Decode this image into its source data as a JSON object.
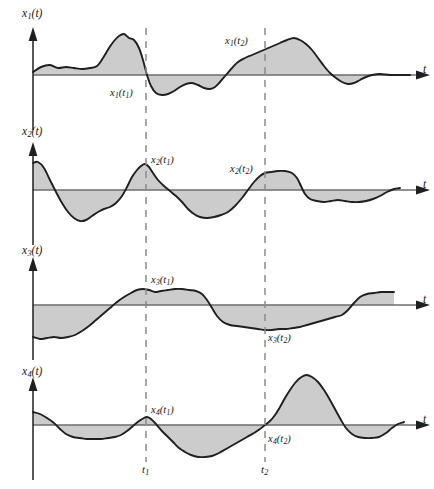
{
  "figure": {
    "type": "ensemble-of-sample-functions",
    "panel_count": 4,
    "line_color": "#1f1f1f",
    "fill_color": "#c9c9c9",
    "dash_color": "#8a8a8a",
    "background": "#ffffff"
  },
  "axes": {
    "time_axis_label": "t",
    "tick_labels": [
      {
        "name": "t1",
        "base": "t",
        "sub": "1",
        "x": 146
      },
      {
        "name": "t2",
        "base": "t",
        "sub": "2",
        "x": 265
      }
    ]
  },
  "panels": [
    {
      "id": "panel-1",
      "axis_label": {
        "base": "x",
        "sub": "1",
        "arg": "(t)"
      },
      "point_labels": [
        {
          "base": "x",
          "sub": "1",
          "arg": "(t",
          "argsub": "1",
          "argend": ")"
        },
        {
          "base": "x",
          "sub": "1",
          "arg": "(t",
          "argsub": "2",
          "argend": ")"
        }
      ]
    },
    {
      "id": "panel-2",
      "axis_label": {
        "base": "x",
        "sub": "2",
        "arg": "(t)"
      },
      "point_labels": [
        {
          "base": "x",
          "sub": "2",
          "arg": "(t",
          "argsub": "1",
          "argend": ")"
        },
        {
          "base": "x",
          "sub": "2",
          "arg": "(t",
          "argsub": "2",
          "argend": ")"
        }
      ]
    },
    {
      "id": "panel-3",
      "axis_label": {
        "base": "x",
        "sub": "3",
        "arg": "(t)"
      },
      "point_labels": [
        {
          "base": "x",
          "sub": "3",
          "arg": "(t",
          "argsub": "1",
          "argend": ")"
        },
        {
          "base": "x",
          "sub": "3",
          "arg": "(t",
          "argsub": "2",
          "argend": ")"
        }
      ]
    },
    {
      "id": "panel-4",
      "axis_label": {
        "base": "x",
        "sub": "4",
        "arg": "(t)"
      },
      "point_labels": [
        {
          "base": "x",
          "sub": "4",
          "arg": "(t",
          "argsub": "1",
          "argend": ")"
        },
        {
          "base": "x",
          "sub": "4",
          "arg": "(t",
          "argsub": "2",
          "argend": ")"
        }
      ]
    }
  ],
  "chart_data": {
    "type": "line",
    "title": "",
    "xlabel": "t",
    "ylabel": "",
    "grid": false,
    "legend": false,
    "markers": {
      "t1": 146,
      "t2": 265
    },
    "series": [
      {
        "name": "x1(t)",
        "baseline_y": 75,
        "points": [
          [
            33,
            72
          ],
          [
            41,
            67
          ],
          [
            50,
            65
          ],
          [
            58,
            68
          ],
          [
            66,
            67
          ],
          [
            74,
            68
          ],
          [
            82,
            69
          ],
          [
            90,
            68
          ],
          [
            97,
            66
          ],
          [
            103,
            58
          ],
          [
            109,
            48
          ],
          [
            114,
            41
          ],
          [
            119,
            36
          ],
          [
            124,
            34
          ],
          [
            129,
            38
          ],
          [
            134,
            40
          ],
          [
            139,
            48
          ],
          [
            143,
            60
          ],
          [
            147,
            75
          ],
          [
            151,
            86
          ],
          [
            156,
            93
          ],
          [
            162,
            95
          ],
          [
            168,
            94
          ],
          [
            174,
            91
          ],
          [
            180,
            87
          ],
          [
            186,
            84
          ],
          [
            192,
            83
          ],
          [
            198,
            85
          ],
          [
            204,
            88
          ],
          [
            210,
            89
          ],
          [
            215,
            87
          ],
          [
            220,
            82
          ],
          [
            226,
            75
          ],
          [
            232,
            68
          ],
          [
            238,
            62
          ],
          [
            245,
            58
          ],
          [
            252,
            55
          ],
          [
            259,
            52
          ],
          [
            266,
            49
          ],
          [
            273,
            46
          ],
          [
            280,
            43
          ],
          [
            287,
            40
          ],
          [
            294,
            38
          ],
          [
            300,
            40
          ],
          [
            306,
            44
          ],
          [
            312,
            50
          ],
          [
            318,
            58
          ],
          [
            324,
            66
          ],
          [
            330,
            73
          ],
          [
            336,
            78
          ],
          [
            342,
            82
          ],
          [
            348,
            84
          ],
          [
            354,
            83
          ],
          [
            360,
            80
          ],
          [
            366,
            77
          ],
          [
            372,
            75
          ],
          [
            380,
            74
          ],
          [
            390,
            75
          ],
          [
            400,
            75
          ],
          [
            410,
            75
          ]
        ]
      },
      {
        "name": "x2(t)",
        "baseline_y": 190,
        "points": [
          [
            33,
            163
          ],
          [
            38,
            162
          ],
          [
            44,
            168
          ],
          [
            50,
            180
          ],
          [
            56,
            192
          ],
          [
            62,
            203
          ],
          [
            68,
            212
          ],
          [
            74,
            218
          ],
          [
            80,
            221
          ],
          [
            86,
            220
          ],
          [
            92,
            216
          ],
          [
            98,
            212
          ],
          [
            104,
            209
          ],
          [
            110,
            207
          ],
          [
            116,
            203
          ],
          [
            122,
            196
          ],
          [
            127,
            187
          ],
          [
            132,
            177
          ],
          [
            137,
            170
          ],
          [
            141,
            166
          ],
          [
            145,
            164
          ],
          [
            149,
            167
          ],
          [
            153,
            173
          ],
          [
            158,
            180
          ],
          [
            164,
            186
          ],
          [
            170,
            191
          ],
          [
            176,
            196
          ],
          [
            182,
            202
          ],
          [
            188,
            209
          ],
          [
            194,
            214
          ],
          [
            200,
            217
          ],
          [
            207,
            218
          ],
          [
            214,
            217
          ],
          [
            221,
            215
          ],
          [
            228,
            212
          ],
          [
            235,
            206
          ],
          [
            242,
            198
          ],
          [
            248,
            190
          ],
          [
            254,
            182
          ],
          [
            260,
            176
          ],
          [
            265,
            173
          ],
          [
            271,
            172
          ],
          [
            278,
            171
          ],
          [
            285,
            171
          ],
          [
            292,
            173
          ],
          [
            297,
            178
          ],
          [
            301,
            186
          ],
          [
            305,
            194
          ],
          [
            310,
            199
          ],
          [
            317,
            201
          ],
          [
            324,
            202
          ],
          [
            331,
            201
          ],
          [
            338,
            200
          ],
          [
            345,
            201
          ],
          [
            352,
            202
          ],
          [
            359,
            202
          ],
          [
            366,
            201
          ],
          [
            373,
            199
          ],
          [
            380,
            196
          ],
          [
            387,
            192
          ],
          [
            394,
            189
          ],
          [
            400,
            188
          ]
        ]
      },
      {
        "name": "x3(t)",
        "baseline_y": 305,
        "points": [
          [
            33,
            337
          ],
          [
            40,
            339
          ],
          [
            47,
            338
          ],
          [
            54,
            337
          ],
          [
            61,
            338
          ],
          [
            68,
            337
          ],
          [
            75,
            335
          ],
          [
            82,
            331
          ],
          [
            89,
            326
          ],
          [
            96,
            320
          ],
          [
            103,
            314
          ],
          [
            110,
            308
          ],
          [
            117,
            302
          ],
          [
            124,
            297
          ],
          [
            131,
            293
          ],
          [
            137,
            290
          ],
          [
            143,
            289
          ],
          [
            149,
            290
          ],
          [
            155,
            292
          ],
          [
            161,
            291
          ],
          [
            168,
            290
          ],
          [
            175,
            289
          ],
          [
            182,
            289
          ],
          [
            189,
            290
          ],
          [
            196,
            291
          ],
          [
            202,
            294
          ],
          [
            207,
            300
          ],
          [
            212,
            308
          ],
          [
            217,
            316
          ],
          [
            223,
            322
          ],
          [
            230,
            325
          ],
          [
            237,
            326
          ],
          [
            244,
            327
          ],
          [
            251,
            328
          ],
          [
            258,
            329
          ],
          [
            265,
            330
          ],
          [
            272,
            330
          ],
          [
            279,
            329
          ],
          [
            286,
            329
          ],
          [
            293,
            328
          ],
          [
            300,
            327
          ],
          [
            307,
            325
          ],
          [
            314,
            323
          ],
          [
            321,
            321
          ],
          [
            328,
            319
          ],
          [
            335,
            317
          ],
          [
            342,
            315
          ],
          [
            348,
            310
          ],
          [
            354,
            303
          ],
          [
            360,
            297
          ],
          [
            367,
            294
          ],
          [
            374,
            293
          ],
          [
            381,
            292
          ],
          [
            388,
            292
          ],
          [
            394,
            292
          ]
        ]
      },
      {
        "name": "x4(t)",
        "baseline_y": 425,
        "points": [
          [
            33,
            412
          ],
          [
            40,
            414
          ],
          [
            47,
            418
          ],
          [
            54,
            423
          ],
          [
            60,
            429
          ],
          [
            66,
            434
          ],
          [
            73,
            437
          ],
          [
            80,
            438
          ],
          [
            87,
            439
          ],
          [
            94,
            439
          ],
          [
            101,
            439
          ],
          [
            108,
            438
          ],
          [
            115,
            437
          ],
          [
            121,
            435
          ],
          [
            127,
            431
          ],
          [
            133,
            426
          ],
          [
            139,
            421
          ],
          [
            144,
            418
          ],
          [
            147,
            417
          ],
          [
            151,
            419
          ],
          [
            156,
            424
          ],
          [
            161,
            430
          ],
          [
            167,
            436
          ],
          [
            173,
            442
          ],
          [
            179,
            448
          ],
          [
            185,
            452
          ],
          [
            191,
            455
          ],
          [
            198,
            457
          ],
          [
            205,
            457
          ],
          [
            212,
            456
          ],
          [
            219,
            453
          ],
          [
            226,
            449
          ],
          [
            233,
            445
          ],
          [
            240,
            441
          ],
          [
            247,
            437
          ],
          [
            254,
            433
          ],
          [
            260,
            429
          ],
          [
            265,
            425
          ],
          [
            270,
            421
          ],
          [
            275,
            415
          ],
          [
            280,
            407
          ],
          [
            285,
            398
          ],
          [
            290,
            390
          ],
          [
            295,
            383
          ],
          [
            300,
            378
          ],
          [
            306,
            375
          ],
          [
            312,
            377
          ],
          [
            318,
            382
          ],
          [
            324,
            390
          ],
          [
            330,
            400
          ],
          [
            336,
            411
          ],
          [
            341,
            420
          ],
          [
            346,
            428
          ],
          [
            352,
            434
          ],
          [
            358,
            437
          ],
          [
            365,
            438
          ],
          [
            372,
            438
          ],
          [
            379,
            437
          ],
          [
            386,
            433
          ],
          [
            392,
            428
          ],
          [
            398,
            424
          ],
          [
            404,
            422
          ]
        ]
      }
    ]
  }
}
